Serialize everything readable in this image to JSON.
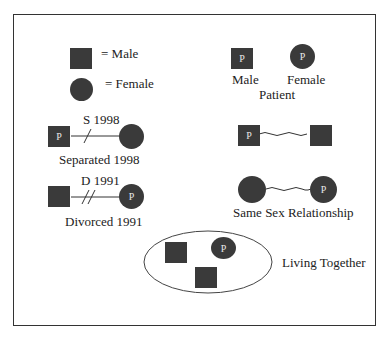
{
  "legend": {
    "male_label": "= Male",
    "female_label": "= Female"
  },
  "patient": {
    "male_label": "Male",
    "female_label": "Female",
    "caption": "Patient",
    "marker": "P"
  },
  "separated": {
    "date_label": "S 1998",
    "caption": "Separated 1998",
    "marker": "P"
  },
  "divorced": {
    "date_label": "D 1991",
    "caption": "Divorced 1991",
    "marker": "P"
  },
  "same_sex": {
    "caption": "Same Sex Relationship",
    "male_marker": "P",
    "female_marker": "P"
  },
  "living_together": {
    "caption": "Living Together",
    "marker": "P"
  },
  "colors": {
    "symbol_fill": "#3a3a3a",
    "line": "#333333",
    "background": "#ffffff"
  }
}
